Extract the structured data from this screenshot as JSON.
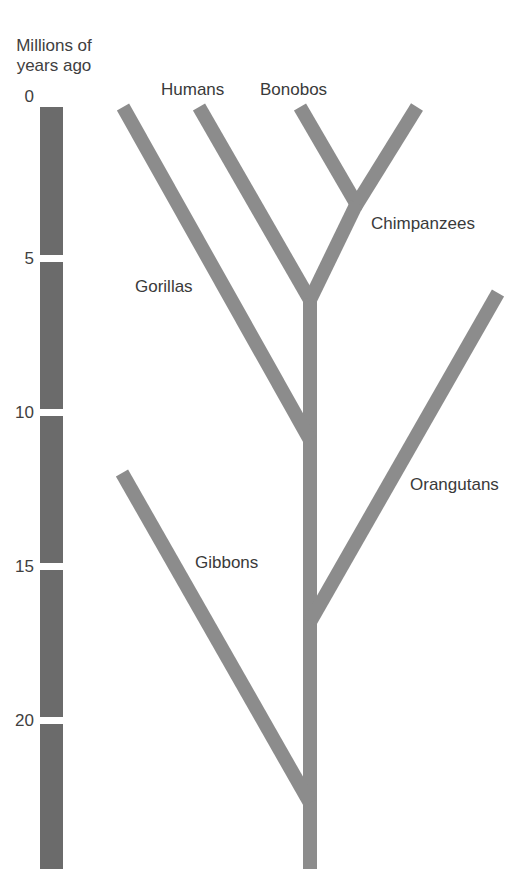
{
  "diagram": {
    "type": "phylogenetic-tree",
    "axis": {
      "title_line1": "Millions of",
      "title_line2": "years ago",
      "ticks": [
        "0",
        "5",
        "10",
        "15",
        "20"
      ],
      "tick_values": [
        0,
        5,
        10,
        15,
        20
      ]
    },
    "species": {
      "humans": "Humans",
      "bonobos": "Bonobos",
      "chimpanzees": "Chimpanzees",
      "gorillas": "Gorillas",
      "orangutans": "Orangutans",
      "gibbons": "Gibbons"
    },
    "divergence_mya": {
      "bonobos_chimpanzees": 3,
      "humans_chimpanzees": 6,
      "gorillas": 10.5,
      "orangutans": 16.5,
      "gibbons": 22.5
    },
    "colors": {
      "time_bar": "#6b6b6b",
      "branches": "#8c8c8c",
      "text": "#3a3a3a",
      "background": "#ffffff"
    }
  }
}
